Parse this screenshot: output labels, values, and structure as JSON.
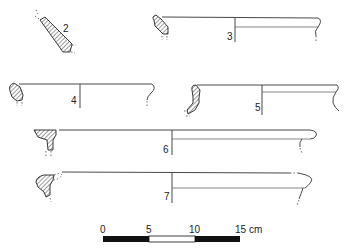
{
  "figure": {
    "type": "archaeological pottery profile drawings",
    "vessels": [
      {
        "number": "2",
        "label": "2"
      },
      {
        "number": "3",
        "label": "3"
      },
      {
        "number": "4",
        "label": "4"
      },
      {
        "number": "5",
        "label": "5"
      },
      {
        "number": "6",
        "label": "6"
      },
      {
        "number": "7",
        "label": "7"
      }
    ],
    "scale_bar": {
      "ticks": [
        "0",
        "5",
        "10",
        "15 cm"
      ],
      "unit": "cm",
      "segments": [
        "black",
        "white",
        "black"
      ]
    }
  },
  "colors": {
    "ink": "#222222",
    "background": "#ffffff"
  }
}
